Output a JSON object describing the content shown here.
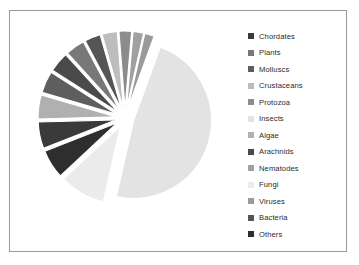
{
  "figure": {
    "background_color": "#ffffff",
    "border_color": "#9a9a9a"
  },
  "legend": {
    "position": "right",
    "entries": [
      {
        "label": "Chordates",
        "color": "#3a3a3a"
      },
      {
        "label": "Plants",
        "color": "#787878"
      },
      {
        "label": "Molluscs",
        "color": "#5e5e5e"
      },
      {
        "label": "Crustaceans",
        "color": "#bdbdbd"
      },
      {
        "label": "Protozoa",
        "color": "#8c8c8c"
      },
      {
        "label": "Insects",
        "color": "#e3e3e3"
      },
      {
        "label": "Algae",
        "color": "#b0b0b0"
      },
      {
        "label": "Arachnids",
        "color": "#4a4a4a"
      },
      {
        "label": "Nematodes",
        "color": "#a0a0a0"
      },
      {
        "label": "Fungi",
        "color": "#ebebeb"
      },
      {
        "label": "Viruses",
        "color": "#9a9a9a"
      },
      {
        "label": "Bacteria",
        "color": "#555555"
      },
      {
        "label": "Others",
        "color": "#2e2e2e"
      }
    ]
  },
  "chart_data": {
    "type": "pie",
    "title": "",
    "exploded": true,
    "start_angle": 20,
    "direction": "clockwise",
    "legend_position": "right",
    "categories": [
      "Chordates",
      "Plants",
      "Molluscs",
      "Crustaceans",
      "Protozoa",
      "Insects",
      "Algae",
      "Arachnids",
      "Nematodes",
      "Fungi",
      "Viruses",
      "Bacteria",
      "Others"
    ],
    "values": [
      5.5,
      4.0,
      4.5,
      3.2,
      2.6,
      48.0,
      5.0,
      4.2,
      2.2,
      9.5,
      2.0,
      3.3,
      6.0
    ],
    "colors": [
      "#3a3a3a",
      "#787878",
      "#5e5e5e",
      "#bdbdbd",
      "#8c8c8c",
      "#e3e3e3",
      "#b0b0b0",
      "#4a4a4a",
      "#a0a0a0",
      "#ebebeb",
      "#9a9a9a",
      "#555555",
      "#2e2e2e"
    ],
    "slices": [
      {
        "label": "Insects",
        "value": 48.0,
        "color": "#e3e3e3",
        "start_deg": 20,
        "end_deg": 192.8
      },
      {
        "label": "Fungi",
        "value": 9.5,
        "color": "#ebebeb",
        "start_deg": 192.8,
        "end_deg": 227.0
      },
      {
        "label": "Others",
        "value": 6.0,
        "color": "#2e2e2e",
        "start_deg": 227.0,
        "end_deg": 248.6
      },
      {
        "label": "Chordates",
        "value": 5.5,
        "color": "#3a3a3a",
        "start_deg": 248.6,
        "end_deg": 268.4
      },
      {
        "label": "Algae",
        "value": 5.0,
        "color": "#b0b0b0",
        "start_deg": 268.4,
        "end_deg": 286.4
      },
      {
        "label": "Molluscs",
        "value": 4.5,
        "color": "#5e5e5e",
        "start_deg": 286.4,
        "end_deg": 302.6
      },
      {
        "label": "Arachnids",
        "value": 4.2,
        "color": "#4a4a4a",
        "start_deg": 302.6,
        "end_deg": 317.7
      },
      {
        "label": "Plants",
        "value": 4.0,
        "color": "#787878",
        "start_deg": 317.7,
        "end_deg": 332.1
      },
      {
        "label": "Bacteria",
        "value": 3.3,
        "color": "#555555",
        "start_deg": 332.1,
        "end_deg": 344.0
      },
      {
        "label": "Crustaceans",
        "value": 3.2,
        "color": "#bdbdbd",
        "start_deg": 344.0,
        "end_deg": 355.5
      },
      {
        "label": "Protozoa",
        "value": 2.6,
        "color": "#8c8c8c",
        "start_deg": 355.5,
        "end_deg": 364.9
      },
      {
        "label": "Nematodes",
        "value": 2.2,
        "color": "#a0a0a0",
        "start_deg": 364.9,
        "end_deg": 372.8
      },
      {
        "label": "Viruses",
        "value": 2.0,
        "color": "#9a9a9a",
        "start_deg": 372.8,
        "end_deg": 380.0
      }
    ]
  }
}
